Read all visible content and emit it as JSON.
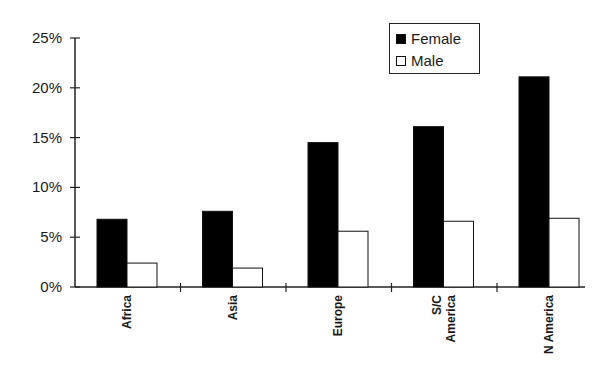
{
  "chart_data": {
    "type": "bar",
    "title": "",
    "xlabel": "",
    "ylabel": "",
    "categories": [
      "Africa",
      "Asia",
      "Europe",
      "S/C America",
      "N America"
    ],
    "category_labels_display": [
      "Africa",
      "Asia",
      "Europe",
      "S/C\nAmerica",
      "N America"
    ],
    "series": [
      {
        "name": "Female",
        "color": "#000000",
        "values": [
          6.8,
          7.6,
          14.5,
          16.1,
          21.1
        ]
      },
      {
        "name": "Male",
        "color": "#ffffff",
        "values": [
          2.4,
          1.9,
          5.6,
          6.6,
          6.9
        ]
      }
    ],
    "ylim": [
      0,
      25
    ],
    "yticks": [
      "0%",
      "5%",
      "10%",
      "15%",
      "20%",
      "25%"
    ],
    "grid": false,
    "legend_position": "top-right inside"
  },
  "legend": {
    "female_label": "Female",
    "male_label": "Male"
  }
}
